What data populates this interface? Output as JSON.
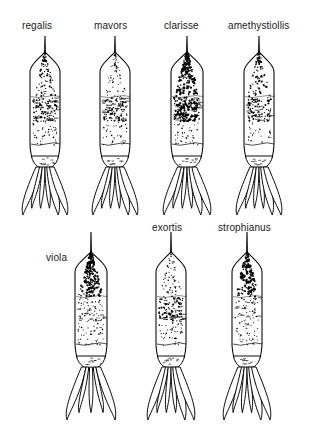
{
  "figure": {
    "kind": "taxonomic-plate",
    "background_color": "#ffffff",
    "ink_color": "#000000",
    "label_color": "#1a1a1a",
    "width": 323,
    "height": 443
  },
  "rows": [
    {
      "name": "top-row",
      "specimens": [
        {
          "label": "regalis",
          "label_x": 22,
          "label_y": 20,
          "label_align": "above",
          "cx": 45,
          "top": 36,
          "stylet_len": 26,
          "body_w": 30,
          "body_top_y": 62,
          "body_bottom_y": 158,
          "fan_bottom_y": 215,
          "fan_w": 44,
          "fan_lobes": 6,
          "shading": {
            "apex_density": "medium",
            "mid_density": "medium",
            "base_density": "light",
            "apex_tone": 0.42,
            "mid_tone": 0.46,
            "base_tone": 0.2
          }
        },
        {
          "label": "mavors",
          "label_x": 94,
          "label_y": 20,
          "label_align": "above",
          "cx": 115,
          "top": 36,
          "stylet_len": 26,
          "body_w": 30,
          "body_top_y": 62,
          "body_bottom_y": 158,
          "fan_bottom_y": 215,
          "fan_w": 44,
          "fan_lobes": 6,
          "shading": {
            "apex_density": "light",
            "mid_density": "medium",
            "base_density": "light",
            "apex_tone": 0.3,
            "mid_tone": 0.5,
            "base_tone": 0.18
          }
        },
        {
          "label": "clarisse",
          "label_x": 164,
          "label_y": 20,
          "label_align": "above",
          "cx": 187,
          "top": 36,
          "stylet_len": 26,
          "body_w": 32,
          "body_top_y": 62,
          "body_bottom_y": 158,
          "fan_bottom_y": 215,
          "fan_w": 46,
          "fan_lobes": 6,
          "shading": {
            "apex_density": "heavy",
            "mid_density": "heavy",
            "base_density": "light",
            "apex_tone": 0.78,
            "mid_tone": 0.72,
            "base_tone": 0.2
          }
        },
        {
          "label": "amethystiollis",
          "label_x": 228,
          "label_y": 20,
          "label_align": "above",
          "cx": 259,
          "top": 36,
          "stylet_len": 26,
          "body_w": 30,
          "body_top_y": 62,
          "body_bottom_y": 158,
          "fan_bottom_y": 215,
          "fan_w": 44,
          "fan_lobes": 6,
          "shading": {
            "apex_density": "medium",
            "mid_density": "medium",
            "base_density": "very-light",
            "apex_tone": 0.4,
            "mid_tone": 0.44,
            "base_tone": 0.12
          }
        }
      ]
    },
    {
      "name": "bottom-row",
      "specimens": [
        {
          "label": "viola",
          "label_x": 46,
          "label_y": 252,
          "label_align": "left",
          "cx": 91,
          "top": 232,
          "stylet_len": 30,
          "body_w": 32,
          "body_top_y": 262,
          "body_bottom_y": 358,
          "fan_bottom_y": 420,
          "fan_w": 48,
          "fan_lobes": 5,
          "shading": {
            "apex_density": "very-heavy",
            "mid_density": "light",
            "base_density": "light",
            "apex_tone": 0.88,
            "mid_tone": 0.26,
            "base_tone": 0.22
          }
        },
        {
          "label": "exortis",
          "label_x": 152,
          "label_y": 222,
          "label_align": "above",
          "cx": 171,
          "top": 232,
          "stylet_len": 30,
          "body_w": 30,
          "body_top_y": 262,
          "body_bottom_y": 358,
          "fan_bottom_y": 420,
          "fan_w": 46,
          "fan_lobes": 6,
          "shading": {
            "apex_density": "light",
            "mid_density": "medium",
            "base_density": "light",
            "apex_tone": 0.3,
            "mid_tone": 0.5,
            "base_tone": 0.22
          }
        },
        {
          "label": "strophianus",
          "label_x": 218,
          "label_y": 222,
          "label_align": "above",
          "cx": 247,
          "top": 232,
          "stylet_len": 30,
          "body_w": 30,
          "body_top_y": 262,
          "body_bottom_y": 358,
          "fan_bottom_y": 420,
          "fan_w": 46,
          "fan_lobes": 6,
          "shading": {
            "apex_density": "heavy",
            "mid_density": "light",
            "base_density": "light",
            "apex_tone": 0.7,
            "mid_tone": 0.22,
            "base_tone": 0.2
          }
        }
      ]
    }
  ]
}
